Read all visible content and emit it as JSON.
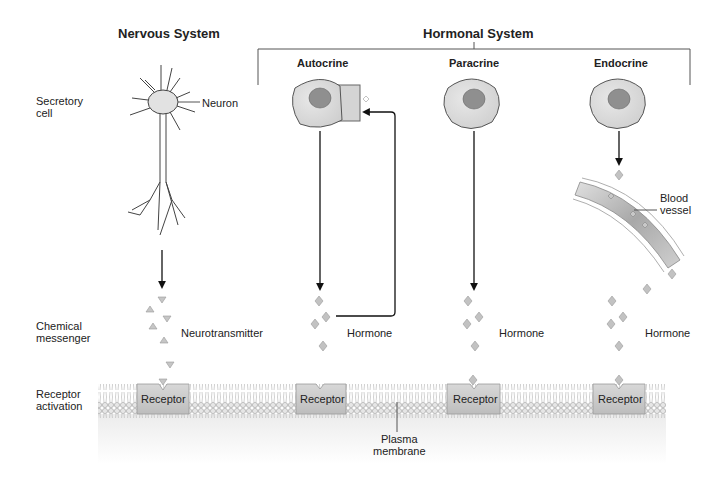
{
  "headers": {
    "nervous": "Nervous System",
    "hormonal": "Hormonal System",
    "autocrine": "Autocrine",
    "paracrine": "Paracrine",
    "endocrine": "Endocrine"
  },
  "row_labels": {
    "secretory_1": "Secretory",
    "secretory_2": "cell",
    "chemical_1": "Chemical",
    "chemical_2": "messenger",
    "receptor_1": "Receptor",
    "receptor_2": "activation"
  },
  "labels": {
    "neuron": "Neuron",
    "neurotransmitter": "Neurotransmitter",
    "hormone_autocrine": "Hormone",
    "hormone_paracrine": "Hormone",
    "hormone_endocrine": "Hormone",
    "blood_1": "Blood",
    "blood_2": "vessel",
    "plasma_1": "Plasma",
    "plasma_2": "membrane"
  },
  "receptors": [
    "Receptor",
    "Receptor",
    "Receptor",
    "Receptor"
  ],
  "colors": {
    "cell_fill": "#dcdcdc",
    "nucleus": "#8f8f8f",
    "messenger": "#bdbdbd",
    "receptor": "#c8c8c8",
    "membrane": "#c9c9c9"
  }
}
